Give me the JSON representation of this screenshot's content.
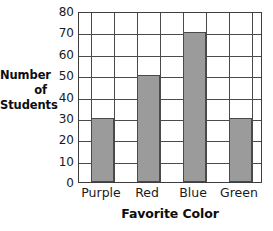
{
  "chart_data": {
    "type": "bar",
    "title": "",
    "categories": [
      "Purple",
      "Red",
      "Blue",
      "Green"
    ],
    "values": [
      30,
      50,
      70,
      30
    ],
    "series": [
      {
        "name": "Number of Students",
        "values": [
          30,
          50,
          70,
          30
        ]
      }
    ],
    "xlabel": "Favorite Color",
    "ylabel": "Number of Students",
    "ylabel_lines": [
      "Number",
      "of",
      "Students"
    ],
    "ylim": [
      0,
      80
    ],
    "ytick_step": 10,
    "yticks": [
      80,
      70,
      60,
      50,
      40,
      30,
      20,
      10,
      0
    ],
    "ytick_labels": [
      "80",
      "70",
      "60",
      "50",
      "40",
      "30",
      "20",
      "10",
      "0"
    ],
    "grid": "horizontal-and-vertical",
    "legend": "none",
    "bar_color": "#9b9b9b",
    "bar_edge_color": "#4a4a4a",
    "axis_color": "#3d3d3d",
    "background": "#ffffff"
  }
}
